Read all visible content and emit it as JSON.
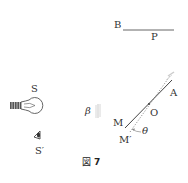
{
  "figure": {
    "caption_prefix": "図",
    "caption_number": "7"
  },
  "labels": {
    "B": "B",
    "P": "P",
    "S": "S",
    "S_prime": "S′",
    "beta": "β",
    "M": "M",
    "M_prime": "M′",
    "O": "O",
    "A": "A",
    "theta": "θ"
  },
  "colors": {
    "line": "#444444",
    "text": "#333333",
    "shade": "#bbbbbb"
  }
}
